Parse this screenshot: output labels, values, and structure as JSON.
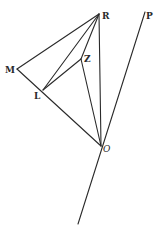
{
  "diagram": {
    "points": {
      "R": {
        "label": "R",
        "x": 99,
        "y": 14
      },
      "P": {
        "label": "P",
        "x": 145,
        "y": 12
      },
      "M": {
        "label": "M",
        "x": 17,
        "y": 69
      },
      "L": {
        "label": "L",
        "x": 43,
        "y": 90
      },
      "Z": {
        "label": "Z",
        "x": 81,
        "y": 59
      },
      "O": {
        "label": "O",
        "x": 101,
        "y": 146
      }
    },
    "segments": [
      [
        "R",
        "M"
      ],
      [
        "R",
        "L"
      ],
      [
        "R",
        "Z"
      ],
      [
        "R",
        "O"
      ],
      [
        "M",
        "L"
      ],
      [
        "L",
        "O"
      ],
      [
        "L",
        "Z"
      ],
      [
        "Z",
        "O"
      ],
      [
        "O",
        "P"
      ],
      [
        "O",
        "tail"
      ]
    ],
    "tail_end": {
      "x": 78,
      "y": 224
    }
  }
}
